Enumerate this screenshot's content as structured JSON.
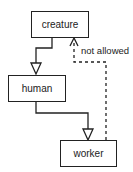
{
  "diagram": {
    "nodes": [
      {
        "id": "creature",
        "label": "creature"
      },
      {
        "id": "human",
        "label": "human"
      },
      {
        "id": "worker",
        "label": "worker"
      }
    ],
    "edges": [
      {
        "from": "human",
        "to": "creature",
        "type": "inheritance",
        "style": "solid"
      },
      {
        "from": "worker",
        "to": "human",
        "type": "inheritance",
        "style": "solid"
      },
      {
        "from": "worker",
        "to": "creature",
        "type": "dependency",
        "style": "dashed",
        "label": "not allowed"
      }
    ],
    "colors": {
      "line": "#222222",
      "background": "#ffffff"
    }
  }
}
